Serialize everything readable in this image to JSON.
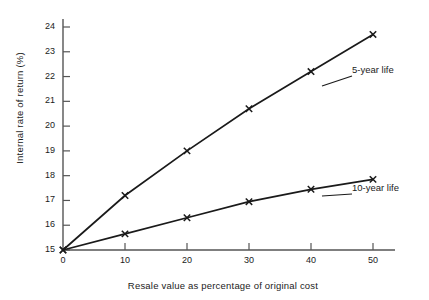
{
  "chart_data": {
    "type": "line",
    "title": "",
    "xlabel": "Resale value as percentage of original cost",
    "ylabel": "Internal rate of return (%)",
    "x": [
      0,
      10,
      20,
      30,
      40,
      50
    ],
    "xlim": [
      0,
      50
    ],
    "ylim": [
      15,
      24
    ],
    "xticks": [
      0,
      10,
      20,
      30,
      40,
      50
    ],
    "xtick_labels": [
      "0",
      "10",
      "20",
      "30",
      "40",
      "50"
    ],
    "yticks": [
      15,
      16,
      17,
      18,
      19,
      20,
      21,
      22,
      23,
      24
    ],
    "ytick_labels": [
      "15",
      "16",
      "17",
      "18",
      "19",
      "20",
      "21",
      "22",
      "23",
      "24"
    ],
    "grid": false,
    "legend_position": "inline-right-annotations",
    "marker": "x",
    "line_color": "#1a1a1a",
    "series": [
      {
        "name": "5-year life",
        "values": [
          15.0,
          17.2,
          19.0,
          20.7,
          22.2,
          23.7
        ]
      },
      {
        "name": "10-year life",
        "values": [
          15.0,
          15.65,
          16.3,
          16.95,
          17.45,
          17.85
        ]
      }
    ],
    "annotations": [
      {
        "text": "5-year life",
        "series": "5-year life"
      },
      {
        "text": "10-year life",
        "series": "10-year life"
      }
    ]
  },
  "colors": {
    "ink": "#1a1a1a",
    "axis": "#555555",
    "background": "#ffffff"
  }
}
